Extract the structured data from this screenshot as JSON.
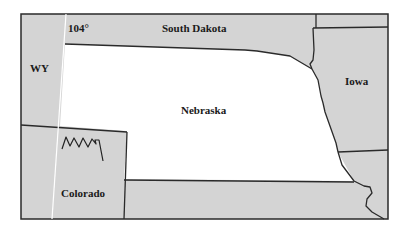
{
  "map": {
    "colors": {
      "neighbor_fill": "#d4d4d4",
      "focus_fill": "#ffffff",
      "border": "#2a2a2a",
      "meridian_line": "#ffffff"
    },
    "regions": {
      "south_dakota": "South Dakota",
      "wyoming": "WY",
      "nebraska": "Nebraska",
      "iowa": "Iowa",
      "colorado": "Colorado"
    },
    "meridian_label": "104°"
  }
}
